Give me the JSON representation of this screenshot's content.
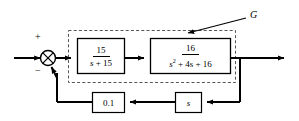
{
  "diagram": {
    "type": "control-system-block-diagram",
    "colors": {
      "line": "#000000",
      "background": "#ffffff",
      "dashed_boundary": "#555555"
    },
    "group_label": "G",
    "summing_junction": {
      "name": "summing-junction",
      "plus_sign": "+",
      "minus_sign": "−"
    },
    "forward_blocks": [
      {
        "name": "plant-block-1",
        "numerator": "15",
        "denominator_prefix": "s",
        "denominator_rest": " + 15",
        "transfer_function": "15 / (s + 15)"
      },
      {
        "name": "plant-block-2",
        "numerator": "16",
        "denominator_var": "s",
        "denominator_exp": "2",
        "denominator_rest": " + 4s + 16",
        "transfer_function": "16 / (s^2 + 4s + 16)"
      }
    ],
    "feedback_blocks": [
      {
        "name": "feedback-gain-block",
        "label": "0.1",
        "value": "0.1"
      },
      {
        "name": "derivative-block",
        "label": "s",
        "value": "s"
      }
    ],
    "signals": {
      "input": "input-arrow",
      "output": "output-arrow",
      "feedback": "feedback-path"
    }
  }
}
